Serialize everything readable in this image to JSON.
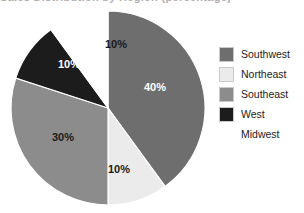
{
  "title_sliver": "Sales Distribution by Region (percentage)",
  "legend": {
    "position": "right",
    "items": [
      {
        "label": "Southwest",
        "color": "#6e6e6e",
        "swatch": true
      },
      {
        "label": "Northeast",
        "color": "#ebebeb",
        "swatch": true
      },
      {
        "label": "Southeast",
        "color": "#8c8c8c",
        "swatch": true
      },
      {
        "label": "West",
        "color": "#1c1c1c",
        "swatch": true
      },
      {
        "label": "Midwest",
        "color": "#ffffff",
        "swatch": false
      }
    ]
  },
  "chart_data": {
    "type": "pie",
    "title": "Sales Distribution by Region (percentage)",
    "xlabel": "",
    "ylabel": "",
    "grid": false,
    "legend_position": "right",
    "start_angle_deg": 0,
    "direction": "clockwise",
    "categories": [
      "Southwest",
      "Northeast",
      "Southeast",
      "West",
      "Midwest"
    ],
    "values": [
      40,
      10,
      30,
      10,
      10
    ],
    "value_unit": "%",
    "slices": [
      {
        "name": "Southwest",
        "value": 40,
        "label": "40%",
        "color": "#6e6e6e",
        "label_color": "#ffffff",
        "label_x": 155,
        "label_y": 88
      },
      {
        "name": "Northeast",
        "value": 10,
        "label": "10%",
        "color": "#ebebeb",
        "label_color": "#1a1a1a",
        "label_x": 119,
        "label_y": 170
      },
      {
        "name": "Southeast",
        "value": 30,
        "label": "30%",
        "color": "#8c8c8c",
        "label_color": "#1a1a1a",
        "label_x": 63,
        "label_y": 138
      },
      {
        "name": "West",
        "value": 10,
        "label": "10%",
        "color": "#1c1c1c",
        "label_color": "#ffffff",
        "label_x": 69,
        "label_y": 65
      },
      {
        "name": "Midwest",
        "value": 10,
        "label": "10%",
        "color": "#ffffff",
        "label_color": "#1a1a1a",
        "label_x": 116,
        "label_y": 45
      }
    ],
    "geometry": {
      "center_x": 108,
      "center_y": 108,
      "radius": 97
    }
  }
}
